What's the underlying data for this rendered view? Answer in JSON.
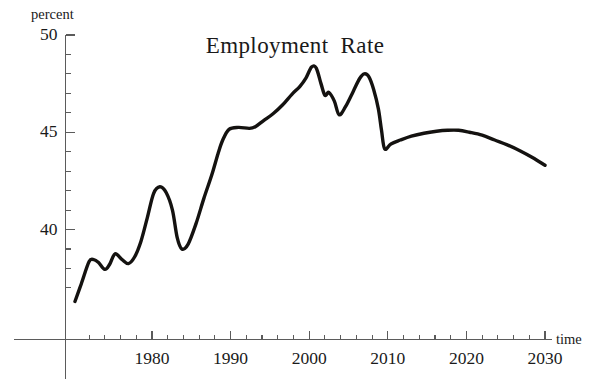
{
  "chart_data": {
    "type": "line",
    "xlabel": "time",
    "ylabel": "percent",
    "xlim": [
      1971,
      2031
    ],
    "ylim": [
      36.5,
      50
    ],
    "grid": false,
    "legend": "none",
    "y_ticks_major": [
      40,
      45,
      50
    ],
    "y_tick_labels": [
      "40",
      "45",
      "50"
    ],
    "y_tick_minor_step": 1,
    "x_ticks_major": [
      1980,
      1990,
      2000,
      2010,
      2020,
      2030
    ],
    "x_tick_labels": [
      "1980",
      "1990",
      "2000",
      "2010",
      "2020",
      "2030"
    ],
    "x_tick_minor_step": 2,
    "series": [
      {
        "name": "Employment Rate",
        "color": "#141210",
        "x": [
          1970.2,
          1971.0,
          1972.0,
          1972.6,
          1973.2,
          1974.0,
          1974.6,
          1975.3,
          1976.2,
          1977.0,
          1977.8,
          1978.6,
          1979.4,
          1980.2,
          1981.0,
          1981.8,
          1982.6,
          1983.2,
          1983.8,
          1984.6,
          1985.6,
          1986.6,
          1987.6,
          1988.4,
          1989.0,
          1989.8,
          1991.0,
          1992.4,
          1993.2,
          1994.2,
          1995.4,
          1996.6,
          1997.8,
          1998.8,
          1999.6,
          2000.3,
          2000.9,
          2001.5,
          2002.0,
          2002.5,
          2003.2,
          2003.8,
          2004.6,
          2005.6,
          2006.4,
          2007.0,
          2007.6,
          2008.2,
          2008.8,
          2009.2,
          2009.6,
          2010.4,
          2011.6,
          2013.0,
          2014.6,
          2016.2,
          2017.6,
          2019.0,
          2020.4,
          2022.0,
          2023.6,
          2025.2,
          2026.8,
          2028.4,
          2030.0
        ],
        "y": [
          36.3,
          37.2,
          38.35,
          38.45,
          38.3,
          37.95,
          38.2,
          38.75,
          38.45,
          38.25,
          38.6,
          39.4,
          40.6,
          41.85,
          42.2,
          41.9,
          41.0,
          39.6,
          39.0,
          39.25,
          40.3,
          41.6,
          42.8,
          43.9,
          44.6,
          45.15,
          45.25,
          45.2,
          45.3,
          45.6,
          45.95,
          46.4,
          46.95,
          47.35,
          47.8,
          48.35,
          48.3,
          47.5,
          46.9,
          47.05,
          46.6,
          45.9,
          46.3,
          47.1,
          47.75,
          48.0,
          47.85,
          47.2,
          46.2,
          45.1,
          44.15,
          44.4,
          44.6,
          44.8,
          44.95,
          45.05,
          45.1,
          45.1,
          45.0,
          44.85,
          44.6,
          44.35,
          44.05,
          43.7,
          43.3
        ]
      }
    ],
    "annotations": []
  },
  "axes": {
    "y_axis_caption": "percent",
    "x_axis_caption": "time"
  }
}
